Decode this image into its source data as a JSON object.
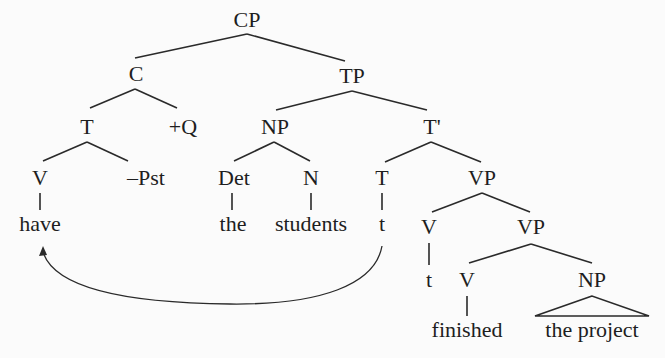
{
  "tree": {
    "nodes": {
      "cp": "CP",
      "c": "C",
      "tp": "TP",
      "t_head": "T",
      "q": "+Q",
      "np_subj": "NP",
      "t_bar": "T'",
      "v_have": "V",
      "neg_past": "–Pst",
      "det": "Det",
      "n": "N",
      "t_trace_node": "T",
      "vp_top": "VP",
      "v_trace_node": "V",
      "vp_low": "VP",
      "v_finished": "V",
      "np_obj": "NP"
    },
    "words": {
      "have": "have",
      "the": "the",
      "students": "students",
      "t_trace": "t",
      "v_trace": "t",
      "finished": "finished",
      "the_project": "the project"
    },
    "movement_arrow": {
      "from": "t",
      "to": "have",
      "description": "head movement of T trace to V have"
    }
  }
}
